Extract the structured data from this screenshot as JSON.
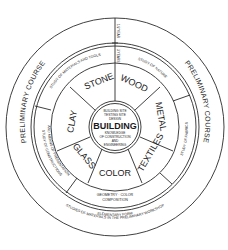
{
  "diagram": {
    "outer_ring": {
      "left_label": "PRELIMINARY COURSE",
      "right_label": "PRELIMINARY COURSE",
      "bottom_label_line1": "ELEMENTARY FORM",
      "bottom_label_line2": "STUDIES OF MATERIALS IN THE PRELIMINARY WORKSHOP"
    },
    "duration": {
      "outer": "1/2 YEAR",
      "middle": "3 YEARS"
    },
    "study_ring": {
      "top_left": "STUDY OF MATERIALS AND TOOLS",
      "top_right": "STUDY OF NATURE",
      "right": "STUDY OF FABRICS",
      "bottom_line1": "GEOMETRY · COLOR",
      "bottom_line2": "COMPOSITION",
      "left_line1": "STUDY OF CONSTRUCTIONS",
      "left_line2": "AND MEANS OF PRESENTATION"
    },
    "materials": [
      "STONE",
      "WOOD",
      "METAL",
      "TEXTILES",
      "COLOR",
      "GLASS",
      "CLAY"
    ],
    "core": {
      "top_line1": "BUILDING SITE",
      "top_line2": "TESTING SITE",
      "top_line3": "DESIGN",
      "title": "BUILDING",
      "bottom_line1": "KNOWLEDGE",
      "bottom_line2": "OF CONSTRUCTION",
      "bottom_line3": "AND",
      "bottom_line4": "ENGINEERING"
    },
    "colors": {
      "stroke": "#2a2a2a",
      "text": "#1a1a1a",
      "background": "#ffffff"
    }
  }
}
